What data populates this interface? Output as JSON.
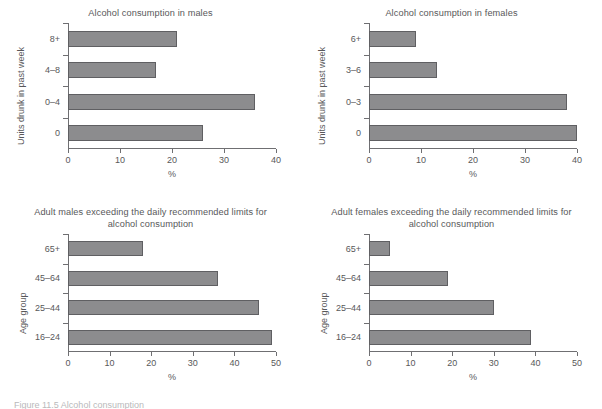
{
  "figure": {
    "caption": "Figure 11.5 Alcohol consumption"
  },
  "panels": [
    {
      "id": "alcohol-consumption-males",
      "title": "Alcohol consumption in males",
      "ylabel": "Units drunk in past week",
      "xlabel": "%",
      "categories": [
        "8+",
        "4–8",
        "0–4",
        "0"
      ],
      "values": [
        21,
        17,
        36,
        26
      ],
      "xticks": [
        "0",
        "10",
        "20",
        "30",
        "40"
      ],
      "xmax": 40
    },
    {
      "id": "alcohol-consumption-females",
      "title": "Alcohol consumption in females",
      "ylabel": "Units drunk in past week",
      "xlabel": "%",
      "categories": [
        "6+",
        "3–6",
        "0–3",
        "0"
      ],
      "values": [
        9,
        13,
        38,
        40
      ],
      "xticks": [
        "0",
        "10",
        "20",
        "30",
        "40"
      ],
      "xmax": 40
    },
    {
      "id": "adult-males-exceeding-limits",
      "title": "Adult males exceeding the daily recommended limits for alcohol consumption",
      "ylabel": "Age group",
      "xlabel": "%",
      "categories": [
        "65+",
        "45–64",
        "25–44",
        "16–24"
      ],
      "values": [
        18,
        36,
        46,
        49
      ],
      "xticks": [
        "0",
        "10",
        "20",
        "30",
        "40",
        "50"
      ],
      "xmax": 50
    },
    {
      "id": "adult-females-exceeding-limits",
      "title": "Adult females exceeding the daily recommended limits for alcohol consumption",
      "ylabel": "Age group",
      "xlabel": "%",
      "categories": [
        "65+",
        "45–64",
        "25–44",
        "16–24"
      ],
      "values": [
        5,
        19,
        30,
        39
      ],
      "xticks": [
        "0",
        "10",
        "20",
        "30",
        "40",
        "50"
      ],
      "xmax": 50
    }
  ],
  "chart_data": [
    {
      "type": "bar",
      "orientation": "horizontal",
      "title": "Alcohol consumption in males",
      "xlabel": "%",
      "ylabel": "Units drunk in past week",
      "categories": [
        "8+",
        "4–8",
        "0–4",
        "0"
      ],
      "values": [
        21,
        17,
        36,
        26
      ],
      "xlim": [
        0,
        40
      ],
      "xticks": [
        0,
        10,
        20,
        30,
        40
      ],
      "grid": false,
      "legend": "none",
      "bar_color": "#8c8c8e"
    },
    {
      "type": "bar",
      "orientation": "horizontal",
      "title": "Alcohol consumption in females",
      "xlabel": "%",
      "ylabel": "Units drunk in past week",
      "categories": [
        "6+",
        "3–6",
        "0–3",
        "0"
      ],
      "values": [
        9,
        13,
        38,
        40
      ],
      "xlim": [
        0,
        40
      ],
      "xticks": [
        0,
        10,
        20,
        30,
        40
      ],
      "grid": false,
      "legend": "none",
      "bar_color": "#8c8c8e"
    },
    {
      "type": "bar",
      "orientation": "horizontal",
      "title": "Adult males exceeding the daily recommended limits for alcohol consumption",
      "xlabel": "%",
      "ylabel": "Age group",
      "categories": [
        "65+",
        "45–64",
        "25–44",
        "16–24"
      ],
      "values": [
        18,
        36,
        46,
        49
      ],
      "xlim": [
        0,
        50
      ],
      "xticks": [
        0,
        10,
        20,
        30,
        40,
        50
      ],
      "grid": false,
      "legend": "none",
      "bar_color": "#8c8c8e"
    },
    {
      "type": "bar",
      "orientation": "horizontal",
      "title": "Adult females exceeding the daily recommended limits for alcohol consumption",
      "xlabel": "%",
      "ylabel": "Age group",
      "categories": [
        "65+",
        "45–64",
        "25–44",
        "16–24"
      ],
      "values": [
        5,
        19,
        30,
        39
      ],
      "xlim": [
        0,
        50
      ],
      "xticks": [
        0,
        10,
        20,
        30,
        40,
        50
      ],
      "grid": false,
      "legend": "none",
      "bar_color": "#8c8c8e"
    }
  ]
}
